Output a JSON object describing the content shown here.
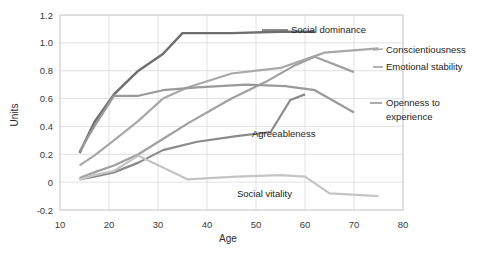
{
  "chart_data": {
    "type": "line",
    "title": "",
    "xlabel": "Age",
    "ylabel": "Units",
    "xlim": [
      10,
      80
    ],
    "ylim": [
      -0.2,
      1.2
    ],
    "xticks": [
      10,
      20,
      30,
      40,
      50,
      60,
      70,
      80
    ],
    "yticks": [
      -0.2,
      0,
      0.2,
      0.4,
      0.6,
      0.8,
      1.0,
      1.2
    ],
    "xtick_labels": [
      "10",
      "20",
      "30",
      "40",
      "50",
      "60",
      "70",
      "80"
    ],
    "ytick_labels": [
      "-0.2",
      "0",
      "0.2",
      "0.4",
      "0.6",
      "0.8",
      "1.0",
      "1.2"
    ],
    "grid": true,
    "legend_position": "inline-right-of-line-ends",
    "series": [
      {
        "name": "Social dominance",
        "color": "#6e6e6e",
        "width": 2.4,
        "label_x": 291,
        "label_y": 33,
        "leader": [
          262,
          30,
          288,
          30
        ],
        "x": [
          14,
          17,
          21,
          26,
          31,
          35,
          45,
          55,
          62
        ],
        "values": [
          0.21,
          0.43,
          0.63,
          0.8,
          0.92,
          1.07,
          1.07,
          1.08,
          1.08
        ]
      },
      {
        "name": "Conscientiousness",
        "color": "#a8a8a8",
        "width": 2.2,
        "label_x": 386,
        "label_y": 53,
        "leader": [
          373,
          50,
          383,
          49
        ],
        "x": [
          14,
          17,
          21,
          26,
          31,
          36,
          45,
          55,
          64,
          75
        ],
        "values": [
          0.12,
          0.19,
          0.3,
          0.44,
          0.6,
          0.68,
          0.78,
          0.82,
          0.93,
          0.96
        ]
      },
      {
        "name": "Emotional stability",
        "color": "#a0a0a0",
        "width": 2.2,
        "label_x": 386,
        "label_y": 70,
        "leader": [
          373,
          67,
          383,
          67
        ],
        "x": [
          14,
          17,
          21,
          26,
          31,
          36,
          45,
          52,
          58,
          62,
          70
        ],
        "values": [
          0.03,
          0.07,
          0.12,
          0.2,
          0.31,
          0.42,
          0.6,
          0.72,
          0.84,
          0.9,
          0.79
        ]
      },
      {
        "name": "Openness to experience",
        "color": "#9a9a9a",
        "width": 2.2,
        "label_x": 386,
        "label_y": 106,
        "label_x2": 386,
        "label_y2": 120,
        "leader": [
          370,
          103,
          382,
          103
        ],
        "x": [
          14,
          17,
          21,
          26,
          31,
          38,
          48,
          56,
          62,
          70
        ],
        "values": [
          0.22,
          0.4,
          0.62,
          0.62,
          0.66,
          0.68,
          0.7,
          0.69,
          0.66,
          0.5
        ]
      },
      {
        "name": "Agreeableness",
        "color": "#8a8a8a",
        "width": 2.2,
        "label_x": 252,
        "label_y": 137,
        "leader": null,
        "x": [
          14,
          17,
          21,
          26,
          31,
          38,
          46,
          53,
          57,
          60
        ],
        "values": [
          0.02,
          0.04,
          0.07,
          0.14,
          0.23,
          0.29,
          0.33,
          0.36,
          0.59,
          0.63
        ]
      },
      {
        "name": "Social vitality",
        "color": "#c4c4c4",
        "width": 2.2,
        "label_x": 237,
        "label_y": 197,
        "leader": null,
        "x": [
          14,
          17,
          21,
          26,
          36,
          46,
          55,
          60,
          65,
          75
        ],
        "values": [
          0.02,
          0.05,
          0.08,
          0.19,
          0.02,
          0.04,
          0.05,
          0.04,
          -0.08,
          -0.1
        ]
      }
    ]
  },
  "plot": {
    "left": 60,
    "right": 403,
    "top": 15,
    "bottom": 210
  },
  "axis": {
    "x_title": "Age",
    "y_title": "Units",
    "x_title_x": 228,
    "x_title_y": 242,
    "y_title_x": 18,
    "y_title_y": 115
  }
}
